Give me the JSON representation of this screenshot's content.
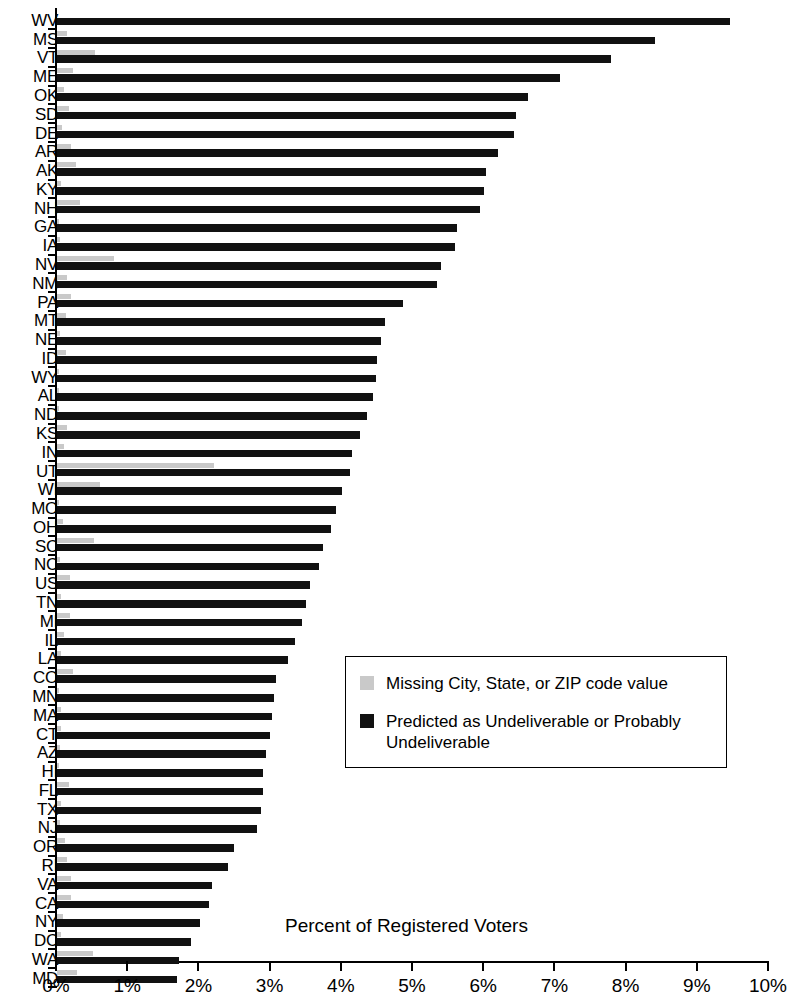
{
  "chart_data": {
    "type": "bar",
    "orientation": "horizontal",
    "title": "",
    "subtitle": "",
    "xlabel": "Percent of Registered Voters",
    "ylabel": "",
    "xlim": [
      0,
      10
    ],
    "xtick_labels": [
      "0%",
      "1%",
      "2%",
      "3%",
      "4%",
      "5%",
      "6%",
      "7%",
      "8%",
      "9%",
      "10%"
    ],
    "xtick_values": [
      0,
      1,
      2,
      3,
      4,
      5,
      6,
      7,
      8,
      9,
      10
    ],
    "grid": false,
    "legend_position": "center-right",
    "categories": [
      "WV",
      "MS",
      "VT",
      "ME",
      "OK",
      "SD",
      "DE",
      "AR",
      "AK",
      "KY",
      "NH",
      "GA",
      "IA",
      "NV",
      "NM",
      "PA",
      "MT",
      "NE",
      "ID",
      "WY",
      "AL",
      "ND",
      "KS",
      "IN",
      "UT",
      "WI",
      "MO",
      "OH",
      "SC",
      "NC",
      "US",
      "TN",
      "MI",
      "IL",
      "LA",
      "CO",
      "MN",
      "MA",
      "CT",
      "AZ",
      "HI",
      "FL",
      "TX",
      "NJ",
      "OR",
      "RI",
      "VA",
      "CA",
      "NY",
      "DC",
      "WA",
      "MD"
    ],
    "series": [
      {
        "name": "Missing City, State, or ZIP code value",
        "color": "#c9c9c9",
        "values": [
          0.0,
          0.14,
          0.53,
          0.22,
          0.1,
          0.17,
          0.07,
          0.19,
          0.27,
          0.05,
          0.32,
          0.03,
          0.04,
          0.8,
          0.14,
          0.19,
          0.13,
          0.04,
          0.13,
          0.02,
          0.03,
          0.02,
          0.14,
          0.1,
          2.2,
          0.6,
          0.03,
          0.08,
          0.52,
          0.04,
          0.18,
          0.06,
          0.18,
          0.1,
          0.06,
          0.23,
          0.02,
          0.05,
          0.06,
          0.04,
          0.03,
          0.17,
          0.06,
          0.04,
          0.11,
          0.14,
          0.2,
          0.2,
          0.09,
          0.05,
          0.5,
          0.28
        ]
      },
      {
        "name": "Predicted as Undeliverable or Probably Undeliverable",
        "color": "#111111",
        "values": [
          9.45,
          8.4,
          7.78,
          7.06,
          6.62,
          6.45,
          6.42,
          6.2,
          6.02,
          6.0,
          5.94,
          5.62,
          5.59,
          5.4,
          5.34,
          4.86,
          4.6,
          4.55,
          4.5,
          4.48,
          4.44,
          4.35,
          4.25,
          4.15,
          4.11,
          4.0,
          3.92,
          3.85,
          3.73,
          3.68,
          3.56,
          3.5,
          3.44,
          3.34,
          3.25,
          3.07,
          3.05,
          3.02,
          2.99,
          2.93,
          2.9,
          2.89,
          2.86,
          2.81,
          2.49,
          2.4,
          2.18,
          2.13,
          2.01,
          1.88,
          1.71,
          1.68
        ]
      }
    ]
  },
  "legend": {
    "items": [
      {
        "label": "Missing City, State, or ZIP code value",
        "color": "#c9c9c9"
      },
      {
        "label": "Predicted as Undeliverable or Probably Undeliverable",
        "color": "#111111"
      }
    ]
  },
  "axis": {
    "x_title": "Percent of Registered Voters"
  }
}
